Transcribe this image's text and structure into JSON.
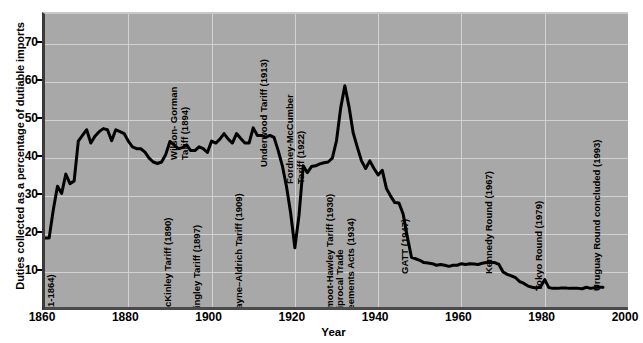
{
  "chart_data": {
    "type": "line",
    "title": "",
    "xlabel": "Year",
    "ylabel": "Duties collected as a percentage of dutiable imports",
    "xlim": [
      1860,
      2000
    ],
    "ylim": [
      0,
      78
    ],
    "xticks": [
      1860,
      1880,
      1900,
      1920,
      1940,
      1960,
      1980,
      2000
    ],
    "yticks": [
      10,
      20,
      30,
      40,
      50,
      60,
      70
    ],
    "grid": true,
    "legend": null,
    "series": [
      {
        "name": "Duties collected as a percentage of dutiable imports",
        "color": "#000000",
        "points": [
          [
            1860,
            19.0
          ],
          [
            1861,
            19.0
          ],
          [
            1862,
            26.5
          ],
          [
            1863,
            32.6
          ],
          [
            1864,
            30.7
          ],
          [
            1865,
            35.8
          ],
          [
            1866,
            33.3
          ],
          [
            1867,
            34.0
          ],
          [
            1868,
            44.5
          ],
          [
            1869,
            46.0
          ],
          [
            1870,
            47.5
          ],
          [
            1871,
            44.0
          ],
          [
            1872,
            45.8
          ],
          [
            1873,
            47.0
          ],
          [
            1874,
            47.8
          ],
          [
            1875,
            47.5
          ],
          [
            1876,
            44.6
          ],
          [
            1877,
            47.5
          ],
          [
            1878,
            47.0
          ],
          [
            1879,
            46.5
          ],
          [
            1880,
            44.5
          ],
          [
            1881,
            43.0
          ],
          [
            1882,
            42.5
          ],
          [
            1883,
            42.5
          ],
          [
            1884,
            41.6
          ],
          [
            1885,
            40.0
          ],
          [
            1886,
            39.0
          ],
          [
            1887,
            38.6
          ],
          [
            1888,
            39.0
          ],
          [
            1889,
            41.0
          ],
          [
            1890,
            44.4
          ],
          [
            1891,
            43.5
          ],
          [
            1892,
            42.5
          ],
          [
            1893,
            42.8
          ],
          [
            1894,
            43.5
          ],
          [
            1895,
            42.0
          ],
          [
            1896,
            42.0
          ],
          [
            1897,
            43.0
          ],
          [
            1898,
            42.5
          ],
          [
            1899,
            41.5
          ],
          [
            1900,
            44.5
          ],
          [
            1901,
            44.0
          ],
          [
            1902,
            45.0
          ],
          [
            1903,
            46.5
          ],
          [
            1904,
            45.0
          ],
          [
            1905,
            44.0
          ],
          [
            1906,
            46.5
          ],
          [
            1907,
            45.2
          ],
          [
            1908,
            44.0
          ],
          [
            1909,
            44.0
          ],
          [
            1910,
            48.0
          ],
          [
            1911,
            46.0
          ],
          [
            1912,
            46.0
          ],
          [
            1913,
            45.5
          ],
          [
            1914,
            46.0
          ],
          [
            1915,
            45.5
          ],
          [
            1916,
            42.0
          ],
          [
            1917,
            38.0
          ],
          [
            1918,
            32.5
          ],
          [
            1919,
            25.5
          ],
          [
            1920,
            16.4
          ],
          [
            1921,
            25.0
          ],
          [
            1922,
            38.0
          ],
          [
            1923,
            36.2
          ],
          [
            1924,
            37.8
          ],
          [
            1925,
            38.0
          ],
          [
            1926,
            38.5
          ],
          [
            1927,
            38.8
          ],
          [
            1928,
            39.0
          ],
          [
            1929,
            40.0
          ],
          [
            1930,
            44.6
          ],
          [
            1931,
            53.2
          ],
          [
            1932,
            59.1
          ],
          [
            1933,
            53.6
          ],
          [
            1934,
            46.7
          ],
          [
            1935,
            42.9
          ],
          [
            1936,
            39.3
          ],
          [
            1937,
            37.3
          ],
          [
            1938,
            39.3
          ],
          [
            1939,
            37.3
          ],
          [
            1940,
            35.6
          ],
          [
            1941,
            36.8
          ],
          [
            1942,
            32.0
          ],
          [
            1943,
            30.0
          ],
          [
            1944,
            28.3
          ],
          [
            1945,
            28.2
          ],
          [
            1946,
            25.3
          ],
          [
            1947,
            19.3
          ],
          [
            1948,
            13.9
          ],
          [
            1949,
            13.5
          ],
          [
            1950,
            13.1
          ],
          [
            1951,
            12.5
          ],
          [
            1952,
            12.4
          ],
          [
            1953,
            12.2
          ],
          [
            1954,
            11.8
          ],
          [
            1955,
            12.0
          ],
          [
            1956,
            11.8
          ],
          [
            1957,
            11.5
          ],
          [
            1958,
            11.8
          ],
          [
            1959,
            11.8
          ],
          [
            1960,
            12.2
          ],
          [
            1961,
            12.0
          ],
          [
            1962,
            12.2
          ],
          [
            1963,
            12.1
          ],
          [
            1964,
            12.0
          ],
          [
            1965,
            12.3
          ],
          [
            1966,
            12.5
          ],
          [
            1967,
            12.5
          ],
          [
            1968,
            12.5
          ],
          [
            1969,
            12.0
          ],
          [
            1970,
            10.0
          ],
          [
            1971,
            9.4
          ],
          [
            1972,
            9.0
          ],
          [
            1973,
            8.5
          ],
          [
            1974,
            7.5
          ],
          [
            1975,
            7.0
          ],
          [
            1976,
            6.3
          ],
          [
            1977,
            6.0
          ],
          [
            1978,
            5.8
          ],
          [
            1979,
            6.1
          ],
          [
            1980,
            8.0
          ],
          [
            1981,
            5.9
          ],
          [
            1982,
            5.7
          ],
          [
            1983,
            5.7
          ],
          [
            1984,
            5.8
          ],
          [
            1985,
            5.8
          ],
          [
            1986,
            5.7
          ],
          [
            1987,
            5.7
          ],
          [
            1988,
            5.7
          ],
          [
            1989,
            5.6
          ],
          [
            1990,
            6.0
          ],
          [
            1991,
            5.7
          ],
          [
            1992,
            5.9
          ],
          [
            1993,
            6.0
          ],
          [
            1994,
            6.0
          ]
        ]
      }
    ],
    "annotations": [
      {
        "id": "morrill",
        "text": "Morrill and War Tariffs\n(1861-1864)",
        "year": 1862,
        "lines": 2,
        "bottom_pct": 2,
        "align": "bottom"
      },
      {
        "id": "mckinley",
        "text": "McKinley Tariff (1890)",
        "year": 1890,
        "lines": 1,
        "bottom_pct": 2,
        "align": "bottom"
      },
      {
        "id": "wilson",
        "text": "Wilson- Gorman\nTariff (1894)",
        "year": 1894,
        "lines": 2,
        "bottom_pct": 58,
        "align": "top"
      },
      {
        "id": "dingley",
        "text": "Dingley Tariff (1897)",
        "year": 1897,
        "lines": 1,
        "bottom_pct": 2,
        "align": "bottom"
      },
      {
        "id": "payne",
        "text": "Payne–Aldrich Tariff (1909)",
        "year": 1907,
        "lines": 1,
        "bottom_pct": 2,
        "align": "bottom"
      },
      {
        "id": "underwood",
        "text": "Underwood Tariff (1913)",
        "year": 1913,
        "lines": 1,
        "bottom_pct": 52,
        "align": "top"
      },
      {
        "id": "fordney",
        "text": "Fordney-McCumber\nTariff (1922)",
        "year": 1922,
        "lines": 2,
        "bottom_pct": 50,
        "align": "top"
      },
      {
        "id": "smoot",
        "text": "Smoot-Hawley Tariff (1930)",
        "year": 1929,
        "lines": 1,
        "bottom_pct": 2,
        "align": "bottom"
      },
      {
        "id": "reciprocal",
        "text": "Reciprocal Trade\nAgreements Acts (1934)",
        "year": 1934,
        "lines": 2,
        "bottom_pct": 2,
        "align": "bottom"
      },
      {
        "id": "gatt",
        "text": "GATT (1947)",
        "year": 1947,
        "lines": 1,
        "bottom_pct": 16,
        "align": "bottom"
      },
      {
        "id": "kennedy",
        "text": "Kennedy Round (1967)",
        "year": 1967,
        "lines": 1,
        "bottom_pct": 16,
        "align": "bottom"
      },
      {
        "id": "tokyo",
        "text": "Tokyo Round (1979)",
        "year": 1979,
        "lines": 1,
        "bottom_pct": 10,
        "align": "bottom"
      },
      {
        "id": "uruguay",
        "text": "Uruguay Round concluded (1993)",
        "year": 1993,
        "lines": 1,
        "bottom_pct": 10,
        "align": "bottom"
      }
    ]
  },
  "style": {
    "plot_background": "#a8a8a8",
    "grid_color": "#d2d2d2",
    "line_color": "#000000",
    "page_background": "#ffffff",
    "text_color": "#000000"
  }
}
